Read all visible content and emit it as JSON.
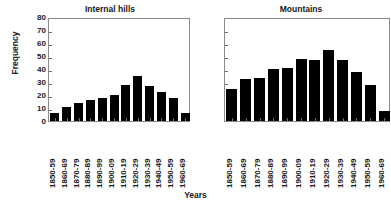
{
  "figure": {
    "xlabel": "Years",
    "ylabel": "Frequency"
  },
  "chart_data": [
    {
      "type": "bar",
      "title": "Internal hills",
      "xlabel": "Years",
      "ylabel": "Frequency",
      "ylim": [
        0,
        80
      ],
      "yticks": [
        0,
        10,
        20,
        30,
        40,
        50,
        60,
        70,
        80
      ],
      "ytick_labels": [
        "0",
        "10",
        "20",
        "30",
        "40",
        "50",
        "60",
        "70",
        "80"
      ],
      "grid": false,
      "legend": false,
      "bar_color": "#000000",
      "categories": [
        "1850-59",
        "1860-69",
        "1870-79",
        "1880-89",
        "1890-99",
        "1900-09",
        "1910-19",
        "1920-29",
        "1930-39",
        "1940-49",
        "1950-59",
        "1960-69"
      ],
      "values": [
        6,
        11,
        14,
        16,
        18,
        20,
        28,
        35,
        27,
        22,
        18,
        6
      ]
    },
    {
      "type": "bar",
      "title": "Mountains",
      "xlabel": "Years",
      "ylabel": "Frequency",
      "ylim": [
        0,
        80
      ],
      "yticks": [
        0,
        10,
        20,
        30,
        40,
        50,
        60,
        70,
        80
      ],
      "ytick_labels": [
        "",
        "",
        "",
        "",
        "",
        "",
        "",
        "",
        ""
      ],
      "grid": false,
      "legend": false,
      "bar_color": "#000000",
      "categories": [
        "1850-59",
        "1860-69",
        "1870-79",
        "1880-89",
        "1890-99",
        "1900-09",
        "1910-19",
        "1920-29",
        "1930-39",
        "1940-49",
        "1950-59",
        "1960-69"
      ],
      "values": [
        25,
        32,
        33,
        40,
        41,
        48,
        47,
        55,
        47,
        38,
        28,
        8
      ]
    }
  ]
}
